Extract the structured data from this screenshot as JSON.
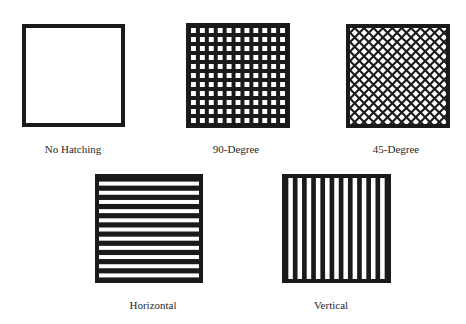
{
  "figure": {
    "ink_color": "#1a1a1a",
    "paper_color": "#ffffff",
    "patterns": [
      {
        "id": "none",
        "label": "No Hatching",
        "type": "none",
        "box": [
          22,
          24,
          103,
          103
        ],
        "label_pos": [
          73,
          143
        ]
      },
      {
        "id": "grid90",
        "label": "90-Degree",
        "type": "grid-90",
        "cells": 11,
        "box": [
          186,
          23,
          104,
          105
        ],
        "label_pos": [
          236,
          143
        ]
      },
      {
        "id": "grid45",
        "label": "45-Degree",
        "type": "grid-45",
        "box": [
          346,
          24,
          104,
          104
        ],
        "label_pos": [
          396,
          143
        ]
      },
      {
        "id": "horiz",
        "label": "Horizontal",
        "type": "horizontal",
        "stripes": 11,
        "box": [
          95,
          174,
          108,
          109
        ],
        "label_pos": [
          153,
          299
        ]
      },
      {
        "id": "vert",
        "label": "Vertical",
        "type": "vertical",
        "stripes": 11,
        "box": [
          282,
          174,
          109,
          109
        ],
        "label_pos": [
          331,
          299
        ]
      }
    ]
  }
}
